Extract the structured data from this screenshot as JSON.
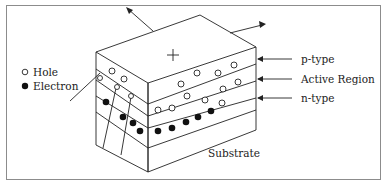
{
  "figure": {
    "type": "semiconductor-layer-diagram",
    "top_face_symbol": "+",
    "legend": {
      "items": [
        {
          "marker": "open-circle",
          "label": "Hole"
        },
        {
          "marker": "filled-circle",
          "label": "Electron"
        }
      ]
    },
    "layer_labels": [
      {
        "id": "p",
        "label": "p-type"
      },
      {
        "id": "active",
        "label": "Active Region"
      },
      {
        "id": "n",
        "label": "n-type"
      }
    ],
    "substrate_label": "Substrate",
    "colors": {
      "line": "#222222",
      "frame": "#8c8c8c",
      "background": "#ffffff"
    }
  }
}
